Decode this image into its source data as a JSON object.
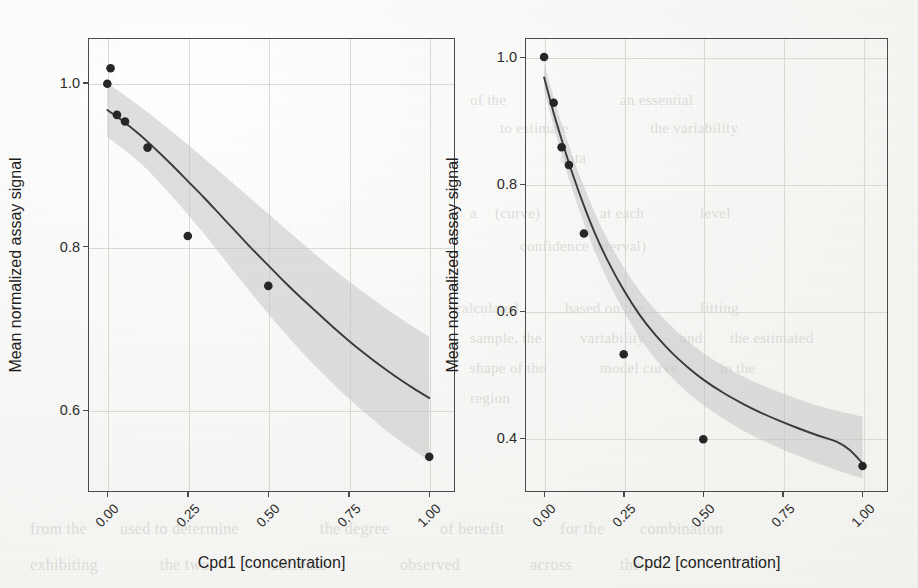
{
  "figure": {
    "background_color": "#f6f6f4",
    "axis_color": "#4a4a4a",
    "grid_color": "#d8d8d4",
    "band_color": "#c4c4c4",
    "line_color": "#3a3a3a",
    "point_color": "#262626",
    "shared_ylabel": "Mean normalized assay signal"
  },
  "chart_data": [
    {
      "type": "scatter",
      "title": "",
      "xlabel": "Cpd1 [concentration]",
      "ylabel": "Mean normalized assay signal",
      "xlim": [
        -0.06,
        1.08
      ],
      "ylim": [
        0.5,
        1.055
      ],
      "xticks": [
        0.0,
        0.25,
        0.5,
        0.75,
        1.0
      ],
      "xticklabels": [
        "0.00",
        "0.25",
        "0.50",
        "0.75",
        "1.00"
      ],
      "yticks": [
        0.6,
        0.8,
        1.0
      ],
      "yticklabels": [
        "0.6",
        "0.8",
        "1.0"
      ],
      "grid": true,
      "legend": "none",
      "points": [
        {
          "x": 0.01,
          "y": 1.018
        },
        {
          "x": 0.0,
          "y": 0.999
        },
        {
          "x": 0.03,
          "y": 0.961
        },
        {
          "x": 0.055,
          "y": 0.953
        },
        {
          "x": 0.125,
          "y": 0.921
        },
        {
          "x": 0.25,
          "y": 0.813
        },
        {
          "x": 0.5,
          "y": 0.752
        },
        {
          "x": 1.0,
          "y": 0.543
        }
      ],
      "fit_curve": [
        {
          "x": 0.0,
          "y": 0.967
        },
        {
          "x": 0.05,
          "y": 0.953
        },
        {
          "x": 0.1,
          "y": 0.937
        },
        {
          "x": 0.15,
          "y": 0.919
        },
        {
          "x": 0.2,
          "y": 0.9
        },
        {
          "x": 0.25,
          "y": 0.88
        },
        {
          "x": 0.3,
          "y": 0.86
        },
        {
          "x": 0.35,
          "y": 0.839
        },
        {
          "x": 0.4,
          "y": 0.818
        },
        {
          "x": 0.45,
          "y": 0.797
        },
        {
          "x": 0.5,
          "y": 0.777
        },
        {
          "x": 0.55,
          "y": 0.757
        },
        {
          "x": 0.6,
          "y": 0.738
        },
        {
          "x": 0.65,
          "y": 0.72
        },
        {
          "x": 0.7,
          "y": 0.702
        },
        {
          "x": 0.75,
          "y": 0.685
        },
        {
          "x": 0.8,
          "y": 0.669
        },
        {
          "x": 0.85,
          "y": 0.654
        },
        {
          "x": 0.9,
          "y": 0.64
        },
        {
          "x": 0.95,
          "y": 0.627
        },
        {
          "x": 1.0,
          "y": 0.615
        }
      ],
      "ci_upper": [
        {
          "x": 0.0,
          "y": 1.0
        },
        {
          "x": 0.1,
          "y": 0.972
        },
        {
          "x": 0.2,
          "y": 0.941
        },
        {
          "x": 0.3,
          "y": 0.908
        },
        {
          "x": 0.4,
          "y": 0.874
        },
        {
          "x": 0.5,
          "y": 0.84
        },
        {
          "x": 0.6,
          "y": 0.806
        },
        {
          "x": 0.7,
          "y": 0.773
        },
        {
          "x": 0.8,
          "y": 0.743
        },
        {
          "x": 0.9,
          "y": 0.715
        },
        {
          "x": 1.0,
          "y": 0.69
        }
      ],
      "ci_lower": [
        {
          "x": 0.0,
          "y": 0.934
        },
        {
          "x": 0.1,
          "y": 0.903
        },
        {
          "x": 0.2,
          "y": 0.862
        },
        {
          "x": 0.3,
          "y": 0.816
        },
        {
          "x": 0.4,
          "y": 0.766
        },
        {
          "x": 0.5,
          "y": 0.718
        },
        {
          "x": 0.6,
          "y": 0.673
        },
        {
          "x": 0.7,
          "y": 0.633
        },
        {
          "x": 0.8,
          "y": 0.597
        },
        {
          "x": 0.9,
          "y": 0.565
        },
        {
          "x": 1.0,
          "y": 0.538
        }
      ]
    },
    {
      "type": "scatter",
      "title": "",
      "xlabel": "Cpd2 [concentration]",
      "ylabel": "Mean normalized assay signal",
      "xlim": [
        -0.06,
        1.08
      ],
      "ylim": [
        0.315,
        1.03
      ],
      "xticks": [
        0.0,
        0.25,
        0.5,
        0.75,
        1.0
      ],
      "xticklabels": [
        "0.00",
        "0.25",
        "0.50",
        "0.75",
        "1.00"
      ],
      "yticks": [
        0.4,
        0.6,
        0.8,
        1.0
      ],
      "yticklabels": [
        "0.4",
        "0.6",
        "0.8",
        "1.0"
      ],
      "grid": true,
      "legend": "none",
      "points": [
        {
          "x": 0.0,
          "y": 1.0
        },
        {
          "x": 0.03,
          "y": 0.928
        },
        {
          "x": 0.055,
          "y": 0.858
        },
        {
          "x": 0.078,
          "y": 0.83
        },
        {
          "x": 0.125,
          "y": 0.722
        },
        {
          "x": 0.25,
          "y": 0.532
        },
        {
          "x": 0.5,
          "y": 0.398
        },
        {
          "x": 1.0,
          "y": 0.356
        }
      ],
      "fit_curve": [
        {
          "x": 0.0,
          "y": 0.968
        },
        {
          "x": 0.03,
          "y": 0.912
        },
        {
          "x": 0.06,
          "y": 0.862
        },
        {
          "x": 0.09,
          "y": 0.815
        },
        {
          "x": 0.125,
          "y": 0.766
        },
        {
          "x": 0.16,
          "y": 0.722
        },
        {
          "x": 0.2,
          "y": 0.679
        },
        {
          "x": 0.25,
          "y": 0.633
        },
        {
          "x": 0.3,
          "y": 0.594
        },
        {
          "x": 0.35,
          "y": 0.562
        },
        {
          "x": 0.4,
          "y": 0.535
        },
        {
          "x": 0.45,
          "y": 0.512
        },
        {
          "x": 0.5,
          "y": 0.492
        },
        {
          "x": 0.56,
          "y": 0.472
        },
        {
          "x": 0.62,
          "y": 0.455
        },
        {
          "x": 0.68,
          "y": 0.44
        },
        {
          "x": 0.74,
          "y": 0.427
        },
        {
          "x": 0.8,
          "y": 0.415
        },
        {
          "x": 0.86,
          "y": 0.404
        },
        {
          "x": 0.92,
          "y": 0.394
        },
        {
          "x": 0.96,
          "y": 0.381
        },
        {
          "x": 1.0,
          "y": 0.36
        }
      ],
      "ci_upper": [
        {
          "x": 0.0,
          "y": 0.99
        },
        {
          "x": 0.06,
          "y": 0.888
        },
        {
          "x": 0.125,
          "y": 0.796
        },
        {
          "x": 0.2,
          "y": 0.712
        },
        {
          "x": 0.3,
          "y": 0.632
        },
        {
          "x": 0.4,
          "y": 0.576
        },
        {
          "x": 0.5,
          "y": 0.534
        },
        {
          "x": 0.62,
          "y": 0.498
        },
        {
          "x": 0.74,
          "y": 0.472
        },
        {
          "x": 0.86,
          "y": 0.451
        },
        {
          "x": 1.0,
          "y": 0.434
        }
      ],
      "ci_lower": [
        {
          "x": 0.0,
          "y": 0.948
        },
        {
          "x": 0.06,
          "y": 0.838
        },
        {
          "x": 0.125,
          "y": 0.738
        },
        {
          "x": 0.2,
          "y": 0.648
        },
        {
          "x": 0.3,
          "y": 0.558
        },
        {
          "x": 0.4,
          "y": 0.496
        },
        {
          "x": 0.5,
          "y": 0.452
        },
        {
          "x": 0.62,
          "y": 0.413
        },
        {
          "x": 0.74,
          "y": 0.384
        },
        {
          "x": 0.86,
          "y": 0.36
        },
        {
          "x": 1.0,
          "y": 0.336
        }
      ]
    }
  ],
  "ghost_text": [
    {
      "t": "of the",
      "x": 470,
      "y": 92,
      "s": 15
    },
    {
      "t": "an essential",
      "x": 620,
      "y": 92,
      "s": 15
    },
    {
      "t": "to estimate",
      "x": 500,
      "y": 120,
      "s": 15
    },
    {
      "t": "the variability",
      "x": 650,
      "y": 120,
      "s": 15
    },
    {
      "t": "data",
      "x": 560,
      "y": 150,
      "s": 15
    },
    {
      "t": "a",
      "x": 470,
      "y": 205,
      "s": 15
    },
    {
      "t": "(curve)",
      "x": 495,
      "y": 205,
      "s": 15
    },
    {
      "t": "at each",
      "x": 600,
      "y": 205,
      "s": 15
    },
    {
      "t": "level",
      "x": 700,
      "y": 205,
      "s": 15
    },
    {
      "t": "confidence interval)",
      "x": 520,
      "y": 238,
      "s": 15
    },
    {
      "t": "calculated",
      "x": 455,
      "y": 300,
      "s": 15
    },
    {
      "t": "based on the",
      "x": 565,
      "y": 300,
      "s": 15
    },
    {
      "t": "fitting",
      "x": 700,
      "y": 300,
      "s": 15
    },
    {
      "t": "sample, the",
      "x": 470,
      "y": 330,
      "s": 15
    },
    {
      "t": "variability",
      "x": 580,
      "y": 330,
      "s": 15
    },
    {
      "t": "and",
      "x": 680,
      "y": 330,
      "s": 15
    },
    {
      "t": "the estimated",
      "x": 730,
      "y": 330,
      "s": 15
    },
    {
      "t": "shape of the",
      "x": 470,
      "y": 360,
      "s": 15
    },
    {
      "t": "model curve",
      "x": 600,
      "y": 360,
      "s": 15
    },
    {
      "t": "in the",
      "x": 720,
      "y": 360,
      "s": 15
    },
    {
      "t": "region",
      "x": 470,
      "y": 390,
      "s": 15
    },
    {
      "t": "from the",
      "x": 30,
      "y": 520,
      "s": 16
    },
    {
      "t": "used to determine",
      "x": 120,
      "y": 520,
      "s": 16
    },
    {
      "t": "the degree",
      "x": 320,
      "y": 520,
      "s": 16
    },
    {
      "t": "of benefit",
      "x": 440,
      "y": 520,
      "s": 16
    },
    {
      "t": "for the",
      "x": 560,
      "y": 520,
      "s": 16
    },
    {
      "t": "combination",
      "x": 640,
      "y": 520,
      "s": 16
    },
    {
      "t": "exhibiting",
      "x": 30,
      "y": 556,
      "s": 16
    },
    {
      "t": "the two",
      "x": 160,
      "y": 556,
      "s": 16
    },
    {
      "t": "decrease",
      "x": 270,
      "y": 556,
      "s": 16
    },
    {
      "t": "observed",
      "x": 400,
      "y": 556,
      "s": 16
    },
    {
      "t": "across",
      "x": 530,
      "y": 556,
      "s": 16
    },
    {
      "t": "the",
      "x": 620,
      "y": 556,
      "s": 16
    }
  ]
}
